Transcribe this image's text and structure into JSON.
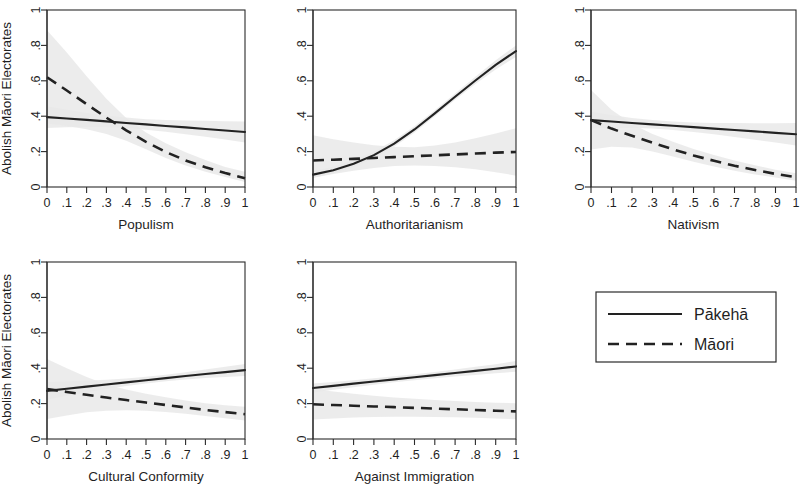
{
  "figure": {
    "background": "#ffffff",
    "series_colors": {
      "line": "#222222",
      "band": "#e9e9e9",
      "band_edge": "#d2d2d2"
    },
    "legend": {
      "entries": [
        {
          "label": "Pākehā",
          "style": "solid"
        },
        {
          "label": "Māori",
          "style": "dashed"
        }
      ]
    },
    "shared": {
      "ylabel": "Abolish Māori Electorates",
      "y_ticks": [
        "0",
        ".2",
        ".4",
        ".6",
        ".8",
        "1"
      ],
      "y_tick_values": [
        0,
        0.2,
        0.4,
        0.6,
        0.8,
        1
      ],
      "x_ticks": [
        "0",
        ".1",
        ".2",
        ".3",
        ".4",
        ".5",
        ".6",
        ".7",
        ".8",
        ".9",
        "1"
      ],
      "x_tick_values": [
        0,
        0.1,
        0.2,
        0.3,
        0.4,
        0.5,
        0.6,
        0.7,
        0.8,
        0.9,
        1
      ],
      "xlim": [
        0,
        1
      ],
      "ylim": [
        0,
        1
      ],
      "grid": false
    }
  },
  "chart_data": [
    {
      "type": "line",
      "panel_index": 0,
      "title": "",
      "xlabel": "Populism",
      "ylabel": "Abolish Māori Electorates",
      "show_ylabel": true,
      "xlim": [
        0,
        1
      ],
      "ylim": [
        0,
        1
      ],
      "x": [
        0,
        0.1,
        0.2,
        0.3,
        0.4,
        0.5,
        0.6,
        0.7,
        0.8,
        0.9,
        1
      ],
      "series": [
        {
          "name": "Pākehā",
          "style": "solid",
          "values": [
            0.395,
            0.387,
            0.379,
            0.371,
            0.362,
            0.354,
            0.345,
            0.337,
            0.328,
            0.319,
            0.311
          ],
          "ci_lower": [
            0.334,
            0.337,
            0.339,
            0.338,
            0.333,
            0.324,
            0.312,
            0.298,
            0.284,
            0.268,
            0.252
          ],
          "ci_upper": [
            0.456,
            0.438,
            0.42,
            0.405,
            0.392,
            0.383,
            0.378,
            0.376,
            0.374,
            0.371,
            0.37
          ]
        },
        {
          "name": "Māori",
          "style": "dashed",
          "values": [
            0.62,
            0.545,
            0.468,
            0.392,
            0.32,
            0.255,
            0.198,
            0.15,
            0.112,
            0.079,
            0.05
          ],
          "ci_lower": [
            0.36,
            0.345,
            0.326,
            0.3,
            0.262,
            0.213,
            0.164,
            0.122,
            0.086,
            0.056,
            0.028
          ],
          "ci_upper": [
            0.886,
            0.76,
            0.626,
            0.498,
            0.39,
            0.308,
            0.247,
            0.196,
            0.152,
            0.113,
            0.086
          ]
        }
      ]
    },
    {
      "type": "line",
      "panel_index": 1,
      "title": "",
      "xlabel": "Authoritarianism",
      "ylabel": "",
      "show_ylabel": false,
      "xlim": [
        0,
        1
      ],
      "ylim": [
        0,
        1
      ],
      "x": [
        0,
        0.1,
        0.2,
        0.3,
        0.4,
        0.5,
        0.6,
        0.7,
        0.8,
        0.9,
        1
      ],
      "series": [
        {
          "name": "Pākehā",
          "style": "solid",
          "values": [
            0.07,
            0.095,
            0.131,
            0.18,
            0.245,
            0.325,
            0.416,
            0.51,
            0.602,
            0.69,
            0.768
          ],
          "ci_lower": [
            0.052,
            0.076,
            0.112,
            0.161,
            0.227,
            0.308,
            0.4,
            0.493,
            0.582,
            0.664,
            0.735
          ],
          "ci_upper": [
            0.091,
            0.116,
            0.152,
            0.2,
            0.264,
            0.343,
            0.433,
            0.528,
            0.623,
            0.716,
            0.8
          ]
        },
        {
          "name": "Māori",
          "style": "dashed",
          "values": [
            0.15,
            0.154,
            0.159,
            0.164,
            0.169,
            0.174,
            0.179,
            0.184,
            0.189,
            0.194,
            0.198
          ],
          "ci_lower": [
            0.052,
            0.073,
            0.092,
            0.108,
            0.118,
            0.122,
            0.119,
            0.112,
            0.1,
            0.084,
            0.064
          ],
          "ci_upper": [
            0.292,
            0.27,
            0.251,
            0.236,
            0.227,
            0.225,
            0.234,
            0.252,
            0.275,
            0.302,
            0.332
          ]
        }
      ]
    },
    {
      "type": "line",
      "panel_index": 2,
      "title": "",
      "xlabel": "Nativism",
      "ylabel": "",
      "show_ylabel": false,
      "xlim": [
        0,
        1
      ],
      "ylim": [
        0,
        1
      ],
      "x": [
        0,
        0.1,
        0.2,
        0.3,
        0.4,
        0.5,
        0.6,
        0.7,
        0.8,
        0.9,
        1
      ],
      "series": [
        {
          "name": "Pākehā",
          "style": "solid",
          "values": [
            0.378,
            0.37,
            0.362,
            0.354,
            0.346,
            0.338,
            0.33,
            0.322,
            0.314,
            0.306,
            0.298
          ],
          "ci_lower": [
            0.33,
            0.334,
            0.334,
            0.33,
            0.322,
            0.311,
            0.298,
            0.283,
            0.267,
            0.251,
            0.234
          ],
          "ci_upper": [
            0.427,
            0.407,
            0.39,
            0.378,
            0.37,
            0.365,
            0.362,
            0.361,
            0.36,
            0.36,
            0.361
          ]
        },
        {
          "name": "Māori",
          "style": "dashed",
          "values": [
            0.378,
            0.33,
            0.289,
            0.25,
            0.213,
            0.178,
            0.148,
            0.12,
            0.096,
            0.074,
            0.055
          ],
          "ci_lower": [
            0.212,
            0.228,
            0.223,
            0.201,
            0.172,
            0.143,
            0.116,
            0.092,
            0.071,
            0.053,
            0.036
          ],
          "ci_upper": [
            0.548,
            0.436,
            0.356,
            0.3,
            0.255,
            0.215,
            0.181,
            0.15,
            0.123,
            0.098,
            0.077
          ]
        }
      ]
    },
    {
      "type": "line",
      "panel_index": 3,
      "title": "",
      "xlabel": "Cultural Conformity",
      "ylabel": "Abolish Māori Electorates",
      "show_ylabel": true,
      "xlim": [
        0,
        1
      ],
      "ylim": [
        0,
        1
      ],
      "x": [
        0,
        0.1,
        0.2,
        0.3,
        0.4,
        0.5,
        0.6,
        0.7,
        0.8,
        0.9,
        1
      ],
      "series": [
        {
          "name": "Pākehā",
          "style": "solid",
          "values": [
            0.272,
            0.284,
            0.296,
            0.308,
            0.32,
            0.332,
            0.344,
            0.356,
            0.367,
            0.378,
            0.389
          ],
          "ci_lower": [
            0.222,
            0.243,
            0.263,
            0.282,
            0.299,
            0.314,
            0.326,
            0.336,
            0.344,
            0.35,
            0.356
          ],
          "ci_upper": [
            0.322,
            0.326,
            0.33,
            0.335,
            0.342,
            0.351,
            0.363,
            0.377,
            0.392,
            0.408,
            0.424
          ]
        },
        {
          "name": "Māori",
          "style": "dashed",
          "values": [
            0.282,
            0.266,
            0.25,
            0.234,
            0.22,
            0.206,
            0.192,
            0.178,
            0.164,
            0.152,
            0.14
          ],
          "ci_lower": [
            0.113,
            0.133,
            0.151,
            0.16,
            0.162,
            0.159,
            0.152,
            0.142,
            0.13,
            0.117,
            0.104
          ],
          "ci_upper": [
            0.452,
            0.4,
            0.35,
            0.308,
            0.28,
            0.256,
            0.236,
            0.218,
            0.202,
            0.19,
            0.182
          ]
        }
      ]
    },
    {
      "type": "line",
      "panel_index": 4,
      "title": "",
      "xlabel": "Against Immigration",
      "ylabel": "",
      "show_ylabel": false,
      "xlim": [
        0,
        1
      ],
      "ylim": [
        0,
        1
      ],
      "x": [
        0,
        0.1,
        0.2,
        0.3,
        0.4,
        0.5,
        0.6,
        0.7,
        0.8,
        0.9,
        1
      ],
      "series": [
        {
          "name": "Pākehā",
          "style": "solid",
          "values": [
            0.288,
            0.3,
            0.313,
            0.325,
            0.337,
            0.349,
            0.361,
            0.373,
            0.385,
            0.397,
            0.41
          ],
          "ci_lower": [
            0.262,
            0.278,
            0.293,
            0.307,
            0.32,
            0.332,
            0.343,
            0.353,
            0.362,
            0.371,
            0.38
          ],
          "ci_upper": [
            0.313,
            0.322,
            0.332,
            0.343,
            0.354,
            0.366,
            0.379,
            0.393,
            0.408,
            0.423,
            0.44
          ]
        },
        {
          "name": "Māori",
          "style": "dashed",
          "values": [
            0.196,
            0.192,
            0.188,
            0.184,
            0.18,
            0.176,
            0.172,
            0.168,
            0.164,
            0.16,
            0.156
          ],
          "ci_lower": [
            0.11,
            0.116,
            0.121,
            0.124,
            0.126,
            0.126,
            0.125,
            0.123,
            0.12,
            0.116,
            0.112
          ],
          "ci_upper": [
            0.282,
            0.268,
            0.256,
            0.245,
            0.235,
            0.227,
            0.22,
            0.214,
            0.209,
            0.205,
            0.202
          ]
        }
      ]
    }
  ]
}
